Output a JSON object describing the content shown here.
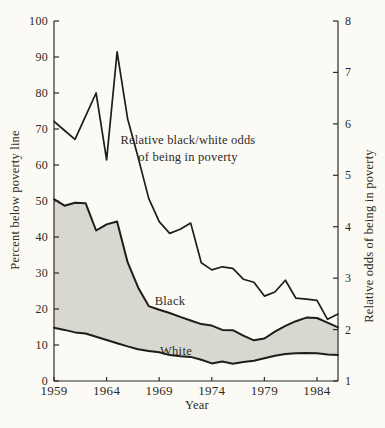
{
  "figure": {
    "left_axis_title": "Percent below poverty line",
    "right_axis_title": "Relative odds of being in poverty",
    "x_axis_title": "Year",
    "annotation_line1": "Relative black/white odds",
    "annotation_line2": "of being in poverty",
    "black_label": "Black",
    "white_label": "White"
  },
  "colors": {
    "paper": "#fbfaf5",
    "band_fill": "#d8d7d0",
    "line": "#1f1d1a",
    "axis": "#2e2a24",
    "text": "#2e2a24"
  },
  "chart_data": {
    "type": "line",
    "title": "",
    "x": [
      1959,
      1960,
      1961,
      1962,
      1963,
      1964,
      1965,
      1966,
      1967,
      1968,
      1969,
      1970,
      1971,
      1972,
      1973,
      1974,
      1975,
      1976,
      1977,
      1978,
      1979,
      1980,
      1981,
      1982,
      1983,
      1984,
      1985,
      1986
    ],
    "series": [
      {
        "name": "Relative black/white odds of being in poverty",
        "axis": "right",
        "values": [
          6.05,
          5.87,
          5.7,
          6.15,
          6.6,
          5.3,
          7.4,
          6.1,
          5.35,
          4.55,
          4.1,
          3.87,
          3.95,
          4.07,
          3.3,
          3.16,
          3.22,
          3.19,
          2.98,
          2.92,
          2.65,
          2.73,
          2.96,
          2.61,
          2.59,
          2.57,
          2.2,
          2.3
        ]
      },
      {
        "name": "Black",
        "axis": "left",
        "values": [
          50.5,
          48.7,
          49.5,
          49.4,
          41.8,
          43.5,
          44.3,
          33.0,
          26.0,
          20.8,
          19.8,
          18.9,
          17.8,
          16.8,
          15.8,
          15.4,
          14.2,
          14.1,
          12.6,
          11.3,
          11.8,
          13.7,
          15.3,
          16.6,
          17.6,
          17.5,
          16.2,
          14.9
        ]
      },
      {
        "name": "White",
        "axis": "left",
        "values": [
          14.8,
          14.2,
          13.5,
          13.2,
          12.3,
          11.4,
          10.5,
          9.6,
          8.8,
          8.3,
          8.0,
          7.2,
          6.9,
          6.7,
          5.9,
          4.9,
          5.4,
          4.8,
          5.3,
          5.6,
          6.3,
          7.0,
          7.5,
          7.7,
          7.8,
          7.7,
          7.4,
          7.2
        ]
      }
    ],
    "shaded_between": [
      "Black",
      "White"
    ],
    "left_axis": {
      "label": "Percent below poverty line",
      "range": [
        0,
        100
      ],
      "ticks": [
        0,
        10,
        20,
        30,
        40,
        50,
        60,
        70,
        80,
        90,
        100
      ]
    },
    "right_axis": {
      "label": "Relative odds of being in poverty",
      "range": [
        1,
        8
      ],
      "ticks": [
        1,
        2,
        3,
        4,
        5,
        6,
        7,
        8
      ]
    },
    "x_axis": {
      "label": "Year",
      "range": [
        1959,
        1986
      ],
      "ticks": [
        1959,
        1964,
        1969,
        1974,
        1979,
        1984
      ]
    },
    "grid": "off",
    "legend": "inline annotations"
  }
}
